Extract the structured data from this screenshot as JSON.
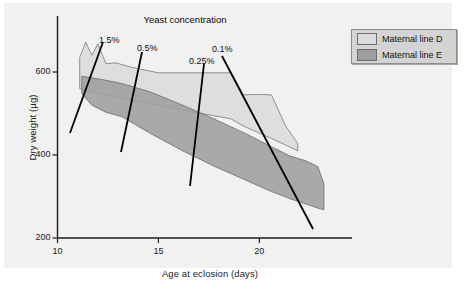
{
  "chart_data": {
    "type": "area",
    "title": "Yeast concentration",
    "xlabel": "Age at eclosion (days)",
    "ylabel": "Dry weight (µg)",
    "xlim": [
      10,
      23.5
    ],
    "ylim": [
      200,
      680
    ],
    "xticks": [
      10,
      15,
      20
    ],
    "xtick_labels": [
      "10",
      "15",
      "20"
    ],
    "yticks": [
      200,
      400,
      600
    ],
    "ytick_labels": [
      "200",
      "400",
      "600"
    ],
    "grid": false,
    "legend_position": "outside-top-right",
    "series": [
      {
        "name": "Maternal line D",
        "color": "#dcdcdc",
        "edge_color": "#787878",
        "kind": "range-band",
        "x": [
          11.1,
          11.4,
          11.7,
          12.0,
          12.4,
          12.9,
          13.6,
          15.0,
          16.6,
          18.6,
          19.2,
          19.9,
          20.6,
          21.3,
          21.9
        ],
        "y_upper": [
          635,
          672,
          640,
          668,
          620,
          622,
          612,
          598,
          598,
          598,
          545,
          546,
          545,
          470,
          428
        ],
        "y_lower": [
          560,
          556,
          552,
          548,
          544,
          540,
          533,
          520,
          505,
          487,
          470,
          455,
          440,
          424,
          410
        ]
      },
      {
        "name": "Maternal line E",
        "color": "#9e9e9e",
        "edge_color": "#6b6b6b",
        "kind": "range-band",
        "x": [
          11.2,
          11.7,
          12.4,
          13.2,
          14.6,
          16.2,
          17.8,
          19.3,
          20.6,
          21.5,
          22.3,
          22.9,
          23.2
        ],
        "y_upper": [
          590,
          586,
          580,
          572,
          552,
          520,
          486,
          452,
          420,
          398,
          386,
          372,
          330
        ],
        "y_lower": [
          548,
          520,
          503,
          492,
          452,
          410,
          372,
          340,
          312,
          295,
          282,
          272,
          268
        ]
      }
    ],
    "annotations": [
      {
        "label": "1.5%",
        "label_x": 99,
        "label_y": 35,
        "line": [
          70,
          133,
          103,
          42
        ]
      },
      {
        "label": "0.5%",
        "label_x": 137,
        "label_y": 43,
        "line": [
          121,
          152,
          142,
          52
        ]
      },
      {
        "label": "0.25%",
        "label_x": 189,
        "label_y": 56,
        "line": [
          190,
          186,
          204,
          64
        ]
      },
      {
        "label": "0.1%",
        "label_x": 212,
        "label_y": 44,
        "line": [
          222,
          56,
          313,
          229
        ]
      }
    ]
  },
  "legend": {
    "items": [
      {
        "label": "Maternal line D",
        "color": "#dcdcdc"
      },
      {
        "label": "Maternal line E",
        "color": "#9e9e9e"
      }
    ]
  },
  "axis": {
    "axis_color": "#1b1b1b"
  }
}
